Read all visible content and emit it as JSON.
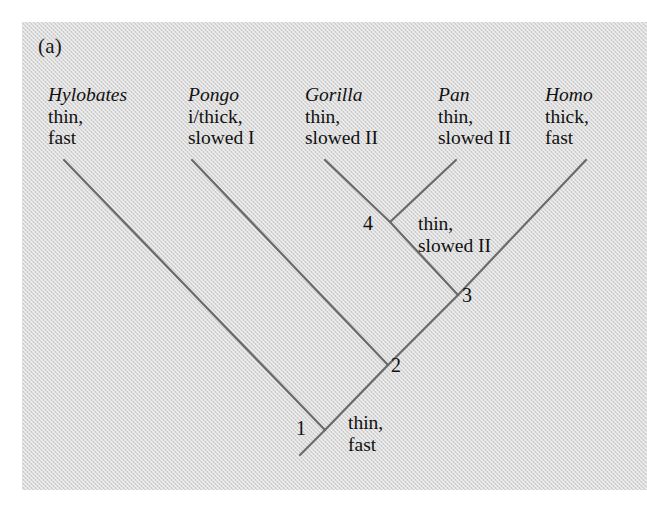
{
  "figure": {
    "panel_letter": "(a)",
    "type": "cladogram",
    "background_color": "#d9d9d9",
    "line_color": "#6a6a6a"
  },
  "taxa": [
    {
      "name": "Hylobates",
      "trait_line1": "thin,",
      "trait_line2": "fast",
      "label_x": 48,
      "label_y": 84,
      "tip_x": 64,
      "tip_y": 160
    },
    {
      "name": "Pongo",
      "trait_line1": "i/thick,",
      "trait_line2": "slowed I",
      "label_x": 188,
      "label_y": 84,
      "tip_x": 192,
      "tip_y": 160
    },
    {
      "name": "Gorilla",
      "trait_line1": "thin,",
      "trait_line2": "slowed II",
      "label_x": 305,
      "label_y": 84,
      "tip_x": 325,
      "tip_y": 160
    },
    {
      "name": "Pan",
      "trait_line1": "thin,",
      "trait_line2": "slowed II",
      "label_x": 438,
      "label_y": 84,
      "tip_x": 456,
      "tip_y": 160
    },
    {
      "name": "Homo",
      "trait_line1": "thick,",
      "trait_line2": "fast",
      "label_x": 545,
      "label_y": 84,
      "tip_x": 586,
      "tip_y": 160
    }
  ],
  "nodes": [
    {
      "label": "1",
      "x": 325,
      "y": 430,
      "num_x": 296,
      "num_y": 418
    },
    {
      "label": "2",
      "x": 388,
      "y": 365,
      "num_x": 391,
      "num_y": 355
    },
    {
      "label": "3",
      "x": 458,
      "y": 295,
      "num_x": 462,
      "num_y": 285
    },
    {
      "label": "4",
      "x": 390,
      "y": 222,
      "num_x": 363,
      "num_y": 213
    }
  ],
  "root_stub": {
    "x1": 325,
    "y1": 430,
    "x2": 300,
    "y2": 455
  },
  "branch_notes": [
    {
      "line1": "thin,",
      "line2": "slowed II",
      "x": 418,
      "y": 213
    },
    {
      "line1": "thin,",
      "line2": "fast",
      "x": 348,
      "y": 412
    }
  ],
  "branches": [
    {
      "from": "Hylobates-tip",
      "to": "node-1",
      "x1": 64,
      "y1": 160,
      "x2": 325,
      "y2": 430
    },
    {
      "from": "node-1",
      "to": "root",
      "x1": 325,
      "y1": 430,
      "x2": 300,
      "y2": 455
    },
    {
      "from": "Pongo-tip",
      "to": "node-2",
      "x1": 192,
      "y1": 160,
      "x2": 388,
      "y2": 365
    },
    {
      "from": "node-2",
      "to": "node-1",
      "x1": 388,
      "y1": 365,
      "x2": 325,
      "y2": 430
    },
    {
      "from": "Gorilla-tip",
      "to": "node-4",
      "x1": 325,
      "y1": 160,
      "x2": 390,
      "y2": 222
    },
    {
      "from": "Pan-tip",
      "to": "node-4",
      "x1": 456,
      "y1": 160,
      "x2": 390,
      "y2": 222
    },
    {
      "from": "node-4",
      "to": "node-3",
      "x1": 390,
      "y1": 222,
      "x2": 458,
      "y2": 295
    },
    {
      "from": "node-3",
      "to": "node-2",
      "x1": 458,
      "y1": 295,
      "x2": 388,
      "y2": 365
    },
    {
      "from": "Homo-tip",
      "to": "node-3",
      "x1": 586,
      "y1": 160,
      "x2": 458,
      "y2": 295
    }
  ]
}
